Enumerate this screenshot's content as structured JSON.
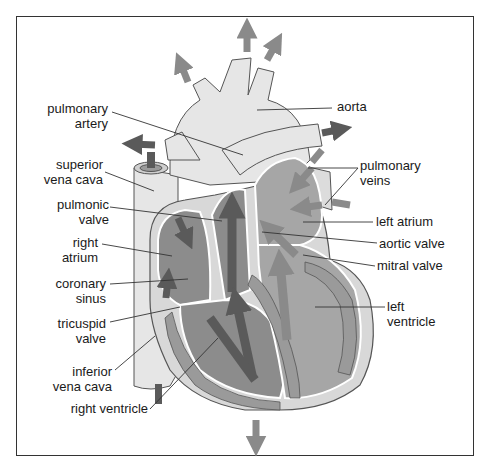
{
  "diagram": {
    "colors": {
      "frame": "#333333",
      "light_tissue": "#e6e6e6",
      "chamber_fill": "#a6a6a6",
      "muscle_fill": "#9a9a9a",
      "dark_arrow": "#5a5a5a",
      "light_arrow": "#8a8a8a",
      "leader_line": "#333333"
    },
    "labels": {
      "pulmonary_artery": {
        "line1": "pulmonary",
        "line2": "artery"
      },
      "superior_vena_cava": {
        "line1": "superior",
        "line2": "vena cava"
      },
      "pulmonic_valve": {
        "line1": "pulmonic",
        "line2": "valve"
      },
      "right_atrium": {
        "line1": "right",
        "line2": "atrium"
      },
      "coronary_sinus": {
        "line1": "coronary",
        "line2": "sinus"
      },
      "tricuspid_valve": {
        "line1": "tricuspid",
        "line2": "valve"
      },
      "inferior_vena_cava": {
        "line1": "inferior",
        "line2": "vena cava"
      },
      "right_ventricle": {
        "line1": "right ventricle"
      },
      "aorta": {
        "line1": "aorta"
      },
      "pulmonary_veins": {
        "line1": "pulmonary",
        "line2": "veins"
      },
      "left_atrium": {
        "line1": "left atrium"
      },
      "aortic_valve": {
        "line1": "aortic valve"
      },
      "mitral_valve": {
        "line1": "mitral valve"
      },
      "left_ventricle": {
        "line1": "left",
        "line2": "ventricle"
      }
    }
  }
}
